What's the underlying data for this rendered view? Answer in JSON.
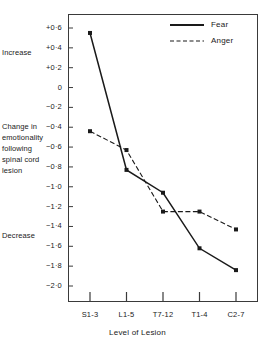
{
  "chart_data": {
    "type": "line",
    "title": "",
    "xlabel": "Level of Lesion",
    "ylabel": "Change in emotionality following spinal cord lesion",
    "categories": [
      "S1-3",
      "L1-5",
      "T7-12",
      "T1-4",
      "C2-7"
    ],
    "ylim": [
      -2.0,
      0.6
    ],
    "yticks": [
      0.6,
      0.4,
      0.2,
      0,
      -0.2,
      -0.4,
      -0.6,
      -0.8,
      -1.0,
      -1.2,
      -1.4,
      -1.6,
      -1.8,
      -2.0
    ],
    "ytick_labels": [
      "+0·6",
      "+0·4",
      "+0·2",
      "0",
      "−0·2",
      "−0·4",
      "−0·6",
      "−0·8",
      "−1·0",
      "−1·2",
      "−1·4",
      "−1·6",
      "−1·8",
      "−2·0"
    ],
    "grid": false,
    "legend_position": "top-right",
    "series": [
      {
        "name": "Fear",
        "style": "solid",
        "color": "#1a1a1a",
        "values": [
          0.55,
          -0.83,
          -1.06,
          -1.62,
          -1.84
        ]
      },
      {
        "name": "Anger",
        "style": "dashed",
        "color": "#1a1a1a",
        "values": [
          -0.44,
          -0.63,
          -1.25,
          -1.25,
          -1.43
        ]
      }
    ],
    "annotations": [
      {
        "id": "increase",
        "text": "Increase",
        "value": 0.35
      },
      {
        "id": "axis-caption-line-1",
        "text": "Change in",
        "value": -0.4
      },
      {
        "id": "axis-caption-line-2",
        "text": "emotionality",
        "value": -0.51
      },
      {
        "id": "axis-caption-line-3",
        "text": "following",
        "value": -0.62
      },
      {
        "id": "axis-caption-line-4",
        "text": "spinal cord",
        "value": -0.73
      },
      {
        "id": "axis-caption-line-5",
        "text": "lesion",
        "value": -0.84
      },
      {
        "id": "decrease",
        "text": "Decrease",
        "value": -1.5
      }
    ]
  }
}
